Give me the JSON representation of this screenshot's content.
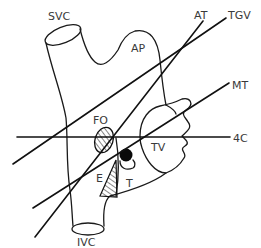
{
  "diagram": {
    "labels": {
      "svc": "SVC",
      "ap": "AP",
      "at": "AT",
      "tgv": "TGV",
      "mt": "MT",
      "four_c": "4C",
      "fo": "FO",
      "tv": "TV",
      "e": "E",
      "t": "T",
      "ivc": "IVC"
    },
    "planes": [
      {
        "name": "TGV",
        "from": [
          13,
          164
        ],
        "to": [
          226,
          18
        ]
      },
      {
        "name": "AT",
        "from": [
          35,
          237
        ],
        "to": [
          203,
          21
        ]
      },
      {
        "name": "MT",
        "from": [
          33,
          208
        ],
        "to": [
          229,
          83
        ]
      },
      {
        "name": "4C",
        "from": [
          17,
          137
        ],
        "to": [
          230,
          137
        ]
      }
    ],
    "colors": {
      "line": "#111111",
      "label": "#3a3a3a",
      "background": "#ffffff"
    }
  }
}
